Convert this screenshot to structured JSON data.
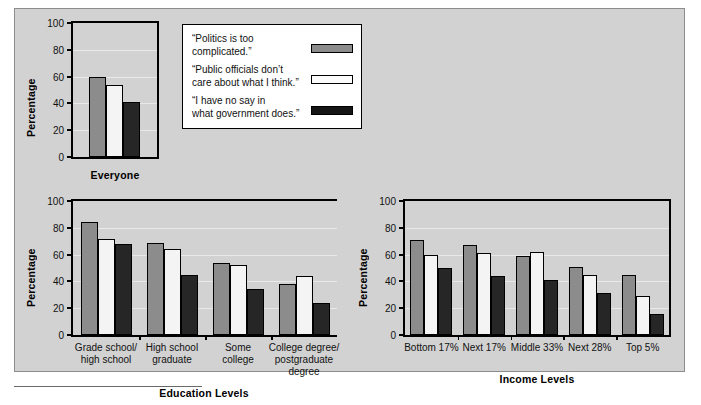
{
  "figure": {
    "background_color": "#d2d2d2",
    "series_colors": [
      "#8c8c8c",
      "#f4f4f4",
      "#262626"
    ]
  },
  "legend": {
    "items": [
      {
        "label": "“Politics is too\ncomplicated.”",
        "swatch": "gray-swatch"
      },
      {
        "label": "“Public officials don’t\ncare about what I think.”",
        "swatch": "white-swatch"
      },
      {
        "label": "“I have no say in\nwhat government does.”",
        "swatch": "black-swatch"
      }
    ]
  },
  "chart_data": [
    {
      "type": "bar",
      "title": "",
      "xlabel": "Everyone",
      "ylabel": "Percentage",
      "ylim": [
        0,
        100
      ],
      "yticks": [
        0,
        20,
        40,
        60,
        80,
        100
      ],
      "grid": true,
      "legend_position": "outside-right",
      "categories": [
        "Everyone"
      ],
      "series": [
        {
          "name": "“Politics is too complicated.”",
          "values": [
            60
          ]
        },
        {
          "name": "“Public officials don’t care about what I think.”",
          "values": [
            54
          ]
        },
        {
          "name": "“I have no say in what government does.”",
          "values": [
            41
          ]
        }
      ]
    },
    {
      "type": "bar",
      "title": "",
      "xlabel": "Education Levels",
      "ylabel": "Percentage",
      "ylim": [
        0,
        100
      ],
      "yticks": [
        0,
        20,
        40,
        60,
        80,
        100
      ],
      "grid": true,
      "legend_position": "none",
      "categories": [
        "Grade school/\nhigh school",
        "High school\ngraduate",
        "Some\ncollege",
        "College degree/\npostgraduate\ndegree"
      ],
      "series": [
        {
          "name": "“Politics is too complicated.”",
          "values": [
            84,
            69,
            54,
            38
          ]
        },
        {
          "name": "“Public officials don’t care about what I think.”",
          "values": [
            72,
            64,
            52,
            44
          ]
        },
        {
          "name": "“I have no say in what government does.”",
          "values": [
            68,
            45,
            34,
            24
          ]
        }
      ]
    },
    {
      "type": "bar",
      "title": "",
      "xlabel": "Income Levels",
      "ylabel": "Percentage",
      "ylim": [
        0,
        100
      ],
      "yticks": [
        0,
        20,
        40,
        60,
        80,
        100
      ],
      "grid": true,
      "legend_position": "none",
      "categories": [
        "Bottom 17%",
        "Next 17%",
        "Middle 33%",
        "Next 28%",
        "Top 5%"
      ],
      "series": [
        {
          "name": "“Politics is too complicated.”",
          "values": [
            71,
            67,
            59,
            51,
            45
          ]
        },
        {
          "name": "“Public officials don’t care about what I think.”",
          "values": [
            60,
            61,
            62,
            45,
            29
          ]
        },
        {
          "name": "“I have no say in what government does.”",
          "values": [
            50,
            44,
            41,
            31,
            16
          ]
        }
      ]
    }
  ]
}
